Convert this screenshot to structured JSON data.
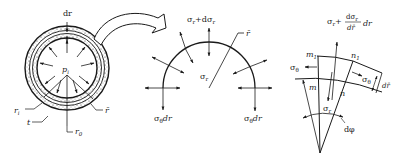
{
  "figure": {
    "panel_a": {
      "title": "thick-walled cylinder cross-section",
      "labels": {
        "dr": "dr",
        "pressure": "p",
        "pressure_sub": "i",
        "inner_radius": "r",
        "inner_radius_sub": "i",
        "outer_radius": "r",
        "outer_radius_sub": "0",
        "thickness": "t",
        "mean_radius": "r̄"
      }
    },
    "panel_b": {
      "title": "half-ring free body",
      "labels": {
        "top_stress": "σr+dσr",
        "top_stress_main": "σ",
        "top_stress_sub": "r",
        "top_stress_plus": "+dσ",
        "top_stress_sub2": "r",
        "center_stress": "σ",
        "center_stress_sub": "r",
        "mean_radius": "r̄",
        "left_hoop": "σ",
        "left_hoop_sub": "θ",
        "left_hoop_suffix": "dr",
        "right_hoop": "σ",
        "right_hoop_sub": "θ",
        "right_hoop_suffix": "dr"
      }
    },
    "panel_c": {
      "title": "infinitesimal element",
      "labels": {
        "top_formula_sigma": "σ",
        "top_formula_sub": "r",
        "top_formula_plus": "+",
        "top_formula_num": "dσ",
        "top_formula_num_sub": "r",
        "top_formula_den": "dr̄",
        "top_formula_suffix": "dr",
        "m1": "m",
        "m1_sub": "1",
        "n1": "n",
        "n1_sub": "1",
        "m": "m",
        "n": "n",
        "left_hoop": "σ",
        "left_hoop_sub": "θ",
        "right_hoop": "σ",
        "right_hoop_sub": "θ",
        "thickness": "dr̄",
        "radial_stress": "σ",
        "radial_stress_sub": "r",
        "angle": "dφ"
      }
    }
  }
}
